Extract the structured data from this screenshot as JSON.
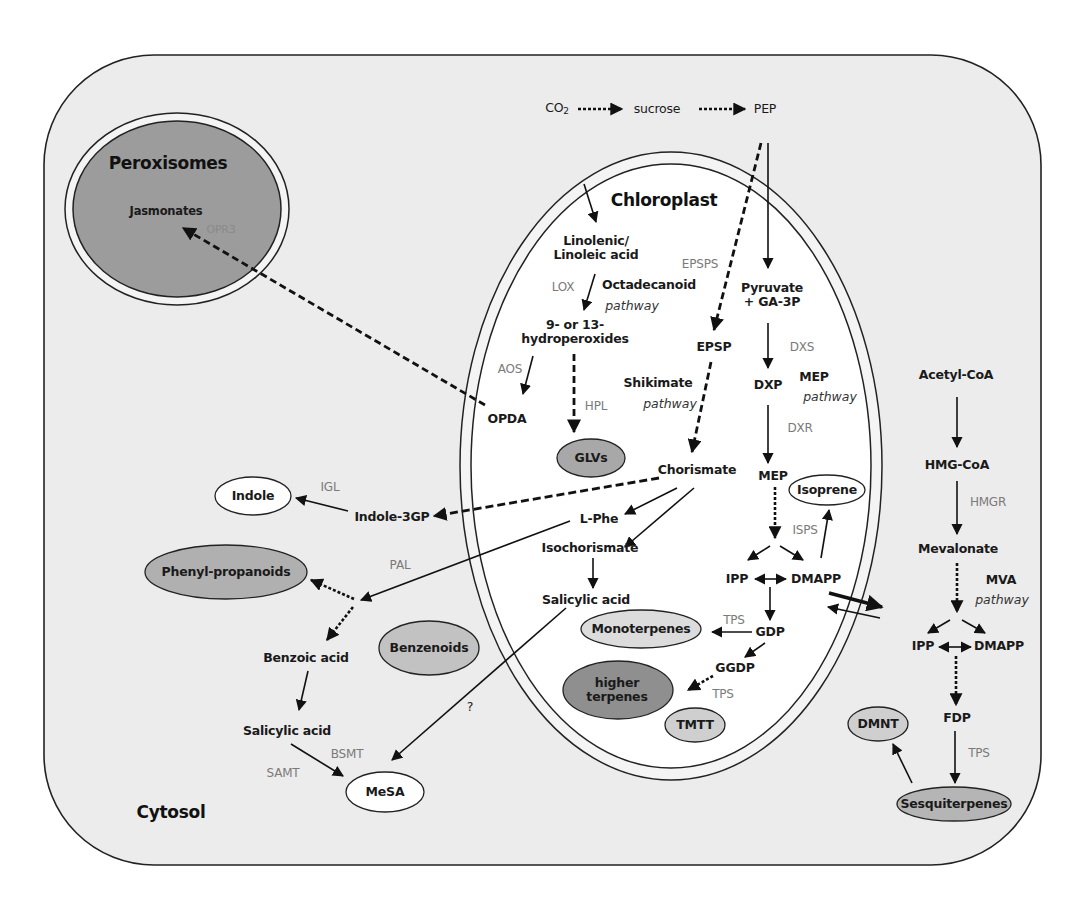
{
  "compartments": {
    "cytosol": "Cytosol",
    "chloroplast": "Chloroplast",
    "peroxisomes": "Peroxisomes"
  },
  "colors": {
    "cell_fill": "#ececec",
    "chloroplast_fill": "#ffffff",
    "peroxisome_fill": "#9c9c9c",
    "product_dark": "#8f8f8f",
    "product_medium": "#b5b5b5",
    "product_light": "#d9d9d9",
    "product_white": "#ffffff",
    "enzyme_text": "#7a7a7a"
  },
  "top_pathway": {
    "co2": "CO",
    "co2_sub": "2",
    "sucrose": "sucrose",
    "pep": "PEP"
  },
  "peroxisome": {
    "jasmonates": "Jasmonates",
    "opr3": "OPR3"
  },
  "chloroplast": {
    "linolenic": "Linolenic/\nLinoleic acid",
    "lox": "LOX",
    "octadecanoid": "Octadecanoid",
    "octadecanoid_pathway": "pathway",
    "hydroperoxides": "9- or 13-\nhydroperoxides",
    "aos": "AOS",
    "opda": "OPDA",
    "hpl": "HPL",
    "glvs": "GLVs",
    "epsps": "EPSPS",
    "epsp": "EPSP",
    "shikimate": "Shikimate",
    "shikimate_pathway": "pathway",
    "chorismate": "Chorismate",
    "lphe": "L-Phe",
    "isochorismate": "Isochorismate",
    "salicylic_acid": "Salicylic acid",
    "pyruvate": "Pyruvate\n+ GA-3P",
    "dxs": "DXS",
    "dxp": "DXP",
    "mep_label": "MEP",
    "mep_pathway": "pathway",
    "dxr": "DXR",
    "mep": "MEP",
    "isoprene": "Isoprene",
    "isps": "ISPS",
    "ipp": "IPP",
    "dmapp": "DMAPP",
    "tps1": "TPS",
    "gdp": "GDP",
    "monoterpenes": "Monoterpenes",
    "ggdp": "GGDP",
    "tps2": "TPS",
    "higher_terpenes": "higher\nterpenes",
    "tmtt": "TMTT"
  },
  "cytosol": {
    "indole": "Indole",
    "igl": "IGL",
    "indole_3gp": "Indole-3GP",
    "phenylpropanoids": "Phenyl-propanoids",
    "pal": "PAL",
    "benzenoids": "Benzenoids",
    "benzoic_acid": "Benzoic acid",
    "salicylic_acid": "Salicylic acid",
    "bsmt": "BSMT",
    "samt": "SAMT",
    "mesa": "MeSA",
    "question": "?",
    "acetyl_coa": "Acetyl-CoA",
    "hmg_coa": "HMG-CoA",
    "hmgr": "HMGR",
    "mevalonate": "Mevalonate",
    "mva_label": "MVA",
    "mva_pathway": "pathway",
    "ipp": "IPP",
    "dmapp": "DMAPP",
    "fdp": "FDP",
    "tps": "TPS",
    "dmnt": "DMNT",
    "sesquiterpenes": "Sesquiterpenes"
  }
}
